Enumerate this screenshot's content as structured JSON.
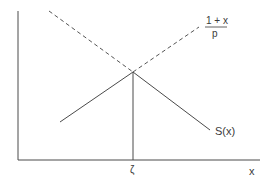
{
  "diagram": {
    "axes": {
      "x_label": "x",
      "origin": [
        18,
        160
      ],
      "x_end": 260,
      "y_top": 11
    },
    "intersection_label": "ζ",
    "curves": [
      {
        "name": "S(x)",
        "label": "S(x)",
        "style": "solid",
        "points": [
          [
            60,
            122
          ],
          [
            133,
            72
          ],
          [
            210,
            130
          ]
        ]
      },
      {
        "name": "dashed-decreasing",
        "label": "",
        "style": "dashed",
        "points": [
          [
            49,
            11
          ],
          [
            133,
            72
          ]
        ]
      },
      {
        "name": "1+x over p",
        "label_numerator": "1 + x",
        "label_denominator": "p",
        "style": "dashed",
        "points": [
          [
            133,
            72
          ],
          [
            199,
            27
          ]
        ]
      }
    ],
    "drop_line": {
      "x": 133,
      "y_from": 72,
      "y_to": 160
    },
    "colors": {
      "line": "#4a4a4a",
      "text": "#3a3a3a",
      "background": "#ffffff"
    }
  }
}
